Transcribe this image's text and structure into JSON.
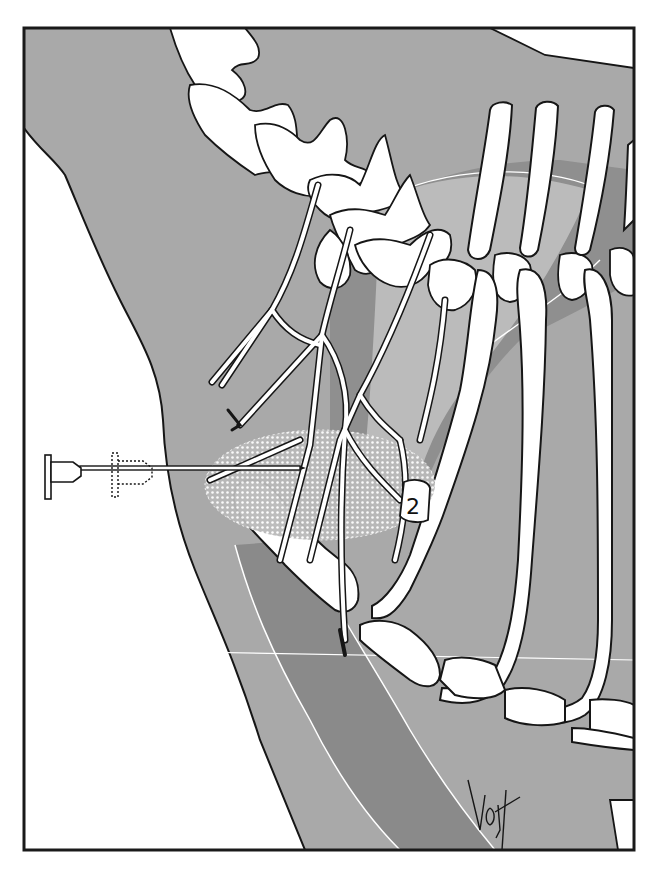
{
  "figure": {
    "labels": [
      {
        "id": "rib-label",
        "text": "2"
      }
    ],
    "signature": "Vojt",
    "elements": [
      "cervical-vertebrae",
      "thoracic-vertebrae",
      "ribs",
      "nerve-roots",
      "nerve-trunks",
      "first-rib",
      "clavicle-band",
      "needle",
      "syringe-hub",
      "syringe-hub-alternate-dotted",
      "injection-spread-area",
      "cervical-pleura-dome",
      "skin-contour",
      "horizontal-reference-line"
    ],
    "colors": {
      "frame": "#1a1a1a",
      "background_tissue": "#a9a9a9",
      "dark_tissue": "#8a8a8a",
      "bone": "#ffffff",
      "outline": "#161616",
      "highlight_area": "#d8d8d8",
      "outside": "#ffffff"
    }
  }
}
